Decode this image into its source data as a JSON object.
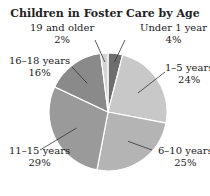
{
  "chart_data": {
    "type": "pie",
    "title": "Children in Foster Care by Age",
    "categories": [
      "Under 1 year",
      "1–5 years",
      "6–10 years",
      "11–15 years",
      "16–18 years",
      "19 and older"
    ],
    "values": [
      4,
      24,
      25,
      29,
      16,
      2
    ],
    "unit": "%",
    "colors": [
      "#6e6e6e",
      "#c8c8c8",
      "#b4b4b4",
      "#9a9a9a",
      "#8a8a8a",
      "#d4d4d4"
    ],
    "labels": [
      {
        "name": "Under 1 year",
        "value": "4%"
      },
      {
        "name": "1–5 years",
        "value": "24%"
      },
      {
        "name": "6–10 years",
        "value": "25%"
      },
      {
        "name": "11–15 years",
        "value": "29%"
      },
      {
        "name": "16–18 years",
        "value": "16%"
      },
      {
        "name": "19 and older",
        "value": "2%"
      }
    ]
  }
}
